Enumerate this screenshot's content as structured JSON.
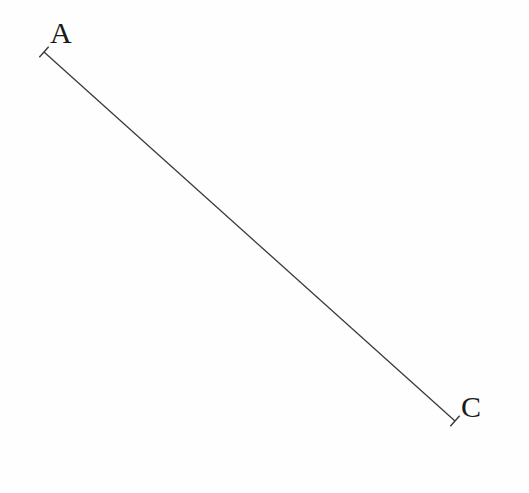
{
  "figure": {
    "type": "geometric-line-segment-diagram",
    "canvas": {
      "width": 529,
      "height": 493,
      "background_color": "#fefefe"
    },
    "style": {
      "line_color": "#3a3a3a",
      "line_width": 1.3,
      "label_color": "#1a1a1a",
      "label_font_size": 30,
      "tick_color": "#3a3a3a",
      "tick_width": 1.4,
      "tick_length": 14
    },
    "points": [
      {
        "id": "A",
        "label": "A",
        "x": 44,
        "y": 52,
        "label_x": 50,
        "label_y": 18,
        "terminator": "perpendicular-tick"
      },
      {
        "id": "C",
        "label": "C",
        "x": 455,
        "y": 421,
        "label_x": 461,
        "label_y": 392,
        "terminator": "perpendicular-tick"
      }
    ],
    "segments": [
      {
        "id": "AC",
        "from": "A",
        "to": "C",
        "x1": 44,
        "y1": 52,
        "x2": 455,
        "y2": 421
      }
    ]
  }
}
